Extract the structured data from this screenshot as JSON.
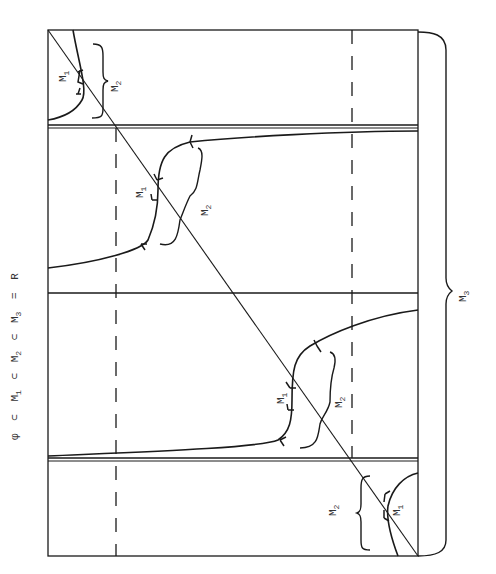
{
  "caption": {
    "phi": "φ",
    "subset": "⊂",
    "eq": "=",
    "M": "M",
    "sub1": "1",
    "sub2": "2",
    "sub3": "3",
    "R": "R",
    "full_text": "φ ⊂ M1 ⊂ M2 ⊂ M3 = R"
  },
  "labels": {
    "top_m1": {
      "base": "M",
      "sub": "1"
    },
    "top_m2": {
      "base": "M",
      "sub": "2"
    },
    "upper_m1": {
      "base": "M",
      "sub": "1"
    },
    "upper_m2": {
      "base": "M",
      "sub": "2"
    },
    "lower_m1": {
      "base": "M",
      "sub": "1"
    },
    "lower_m2": {
      "base": "M",
      "sub": "2"
    },
    "bottom_m2": {
      "base": "M",
      "sub": "2"
    },
    "bottom_m1": {
      "base": "M",
      "sub": "1"
    },
    "outer_m3": {
      "base": "M",
      "sub": "3"
    }
  },
  "colors": {
    "ink": "#1a1a1a",
    "background": "#ffffff"
  }
}
